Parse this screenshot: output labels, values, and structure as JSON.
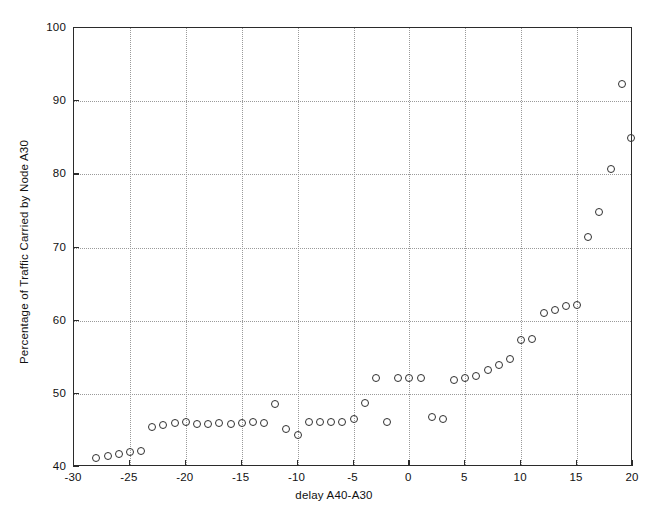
{
  "chart_data": {
    "type": "scatter",
    "title": "",
    "xlabel": "delay A40-A30",
    "ylabel": "Percentage of Traffic Carried by Node  A30",
    "xlim": [
      -30,
      20
    ],
    "ylim": [
      40,
      100
    ],
    "xticks": [
      -30,
      -25,
      -20,
      -15,
      -10,
      -5,
      0,
      5,
      10,
      15,
      20
    ],
    "xticklabels": [
      "-30",
      "-25",
      "-20",
      "-15",
      "-10",
      "-5",
      "0",
      "5",
      "10",
      "15",
      "20"
    ],
    "yticks": [
      40,
      50,
      60,
      70,
      80,
      90,
      100
    ],
    "yticklabels": [
      "40",
      "50",
      "60",
      "70",
      "80",
      "90",
      "100"
    ],
    "grid": true,
    "grid_style": "dotted",
    "legend": null,
    "marker": "open-circle",
    "marker_color": "#303030",
    "series": [
      {
        "name": "Percentage of Traffic Carried by Node A30",
        "x": [
          -28.0,
          -27.0,
          -26.0,
          -25.0,
          -24.0,
          -23.0,
          -22.0,
          -21.0,
          -20.0,
          -19.0,
          -18.0,
          -17.0,
          -16.0,
          -15.0,
          -14.0,
          -13.0,
          -12.0,
          -11.0,
          -10.0,
          -9.0,
          -8.0,
          -7.0,
          -6.0,
          -5.0,
          -4.0,
          -3.0,
          -2.0,
          -1.0,
          0.0,
          1.0,
          2.0,
          3.0,
          4.0,
          5.0,
          6.0,
          7.0,
          8.0,
          9.0,
          10.0,
          11.0,
          12.0,
          13.0,
          14.0,
          15.0,
          16.0,
          17.0,
          18.0,
          19.0,
          19.8
        ],
        "y": [
          41.2,
          41.5,
          41.8,
          42.1,
          42.2,
          45.5,
          45.8,
          46.0,
          46.1,
          45.9,
          45.9,
          46.0,
          45.9,
          46.0,
          46.1,
          46.0,
          48.6,
          45.2,
          44.4,
          46.1,
          46.2,
          46.2,
          46.2,
          46.6,
          48.8,
          52.1,
          46.2,
          52.1,
          52.1,
          52.1,
          46.8,
          46.5,
          51.9,
          52.1,
          52.4,
          53.2,
          54.0,
          54.7,
          57.4,
          57.5,
          61.1,
          61.5,
          62.0,
          62.1,
          71.5,
          74.8,
          80.7,
          92.3,
          85.0
        ]
      }
    ]
  },
  "figure": {
    "background_color": "#ffffff",
    "axis_color": "#2b2b2b",
    "grid_color": "#9a9a9a"
  }
}
